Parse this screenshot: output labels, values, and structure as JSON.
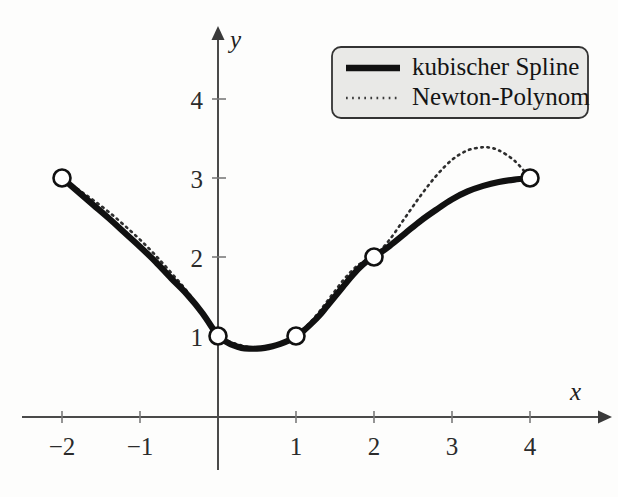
{
  "figure": {
    "background_color": "#fdfdfc",
    "axis_color": "#4a4a4a",
    "spline_color": "#111111",
    "newton_color": "#2e2e2e",
    "legend_fill": "#e9e9e7"
  },
  "axes": {
    "x_name": "x",
    "y_name": "y",
    "x_ticks": [
      {
        "label": "−2",
        "value": -2
      },
      {
        "label": "−1",
        "value": -1
      },
      {
        "label": "1",
        "value": 1
      },
      {
        "label": "2",
        "value": 2
      },
      {
        "label": "3",
        "value": 3
      },
      {
        "label": "4",
        "value": 4
      }
    ],
    "y_ticks": [
      {
        "label": "1",
        "value": 1
      },
      {
        "label": "2",
        "value": 2
      },
      {
        "label": "3",
        "value": 3
      },
      {
        "label": "4",
        "value": 4
      }
    ]
  },
  "legend": {
    "position": "top-right",
    "entries": [
      {
        "label": "kubischer Spline",
        "style": "solid-thick"
      },
      {
        "label": "Newton-Polynom",
        "style": "dotted"
      }
    ]
  },
  "chart_data": {
    "type": "line",
    "title": "",
    "subtitle": "",
    "xlabel": "x",
    "ylabel": "y",
    "xlim": [
      -2.55,
      5.0
    ],
    "ylim": [
      -0.35,
      4.65
    ],
    "grid": false,
    "legend_position": "top-right",
    "annotations": [],
    "knots": {
      "name": "Stützstellen",
      "marker": "open-circle",
      "x": [
        -2,
        0,
        1,
        2,
        4
      ],
      "y": [
        3,
        1,
        1,
        2,
        3
      ]
    },
    "series": [
      {
        "name": "kubischer Spline",
        "style": "solid-thick",
        "color": "#111111",
        "x": [
          -2.0,
          -1.8,
          -1.6,
          -1.4,
          -1.2,
          -1.0,
          -0.8,
          -0.6,
          -0.4,
          -0.2,
          0.0,
          0.1,
          0.2,
          0.3,
          0.4,
          0.5,
          0.6,
          0.7,
          0.8,
          0.9,
          1.0,
          1.1,
          1.2,
          1.3,
          1.4,
          1.5,
          1.6,
          1.7,
          1.8,
          1.9,
          2.0,
          2.2,
          2.4,
          2.6,
          2.8,
          3.0,
          3.2,
          3.4,
          3.6,
          3.8,
          4.0
        ],
        "y": [
          3.0,
          2.83,
          2.66,
          2.49,
          2.31,
          2.13,
          1.94,
          1.73,
          1.53,
          1.29,
          1.0,
          0.93,
          0.88,
          0.85,
          0.84,
          0.84,
          0.85,
          0.87,
          0.9,
          0.94,
          1.0,
          1.07,
          1.16,
          1.26,
          1.38,
          1.5,
          1.62,
          1.74,
          1.85,
          1.94,
          2.0,
          2.14,
          2.3,
          2.46,
          2.6,
          2.73,
          2.83,
          2.9,
          2.95,
          2.98,
          3.0
        ]
      },
      {
        "name": "Newton-Polynom",
        "style": "dotted",
        "color": "#2e2e2e",
        "x": [
          -2.0,
          -1.8,
          -1.6,
          -1.4,
          -1.2,
          -1.0,
          -0.8,
          -0.6,
          -0.4,
          -0.2,
          0.0,
          0.1,
          0.2,
          0.3,
          0.4,
          0.5,
          0.6,
          0.7,
          0.8,
          0.9,
          1.0,
          1.1,
          1.2,
          1.3,
          1.4,
          1.5,
          1.6,
          1.7,
          1.8,
          1.9,
          2.0,
          2.2,
          2.4,
          2.6,
          2.8,
          3.0,
          3.2,
          3.4,
          3.5,
          3.6,
          3.8,
          4.0
        ],
        "y": [
          3.0,
          2.86,
          2.72,
          2.57,
          2.4,
          2.22,
          2.02,
          1.8,
          1.57,
          1.3,
          1.0,
          0.95,
          0.91,
          0.88,
          0.86,
          0.85,
          0.85,
          0.86,
          0.89,
          0.93,
          1.0,
          1.09,
          1.19,
          1.31,
          1.44,
          1.57,
          1.7,
          1.81,
          1.9,
          1.96,
          2.0,
          2.22,
          2.5,
          2.78,
          3.03,
          3.23,
          3.35,
          3.39,
          3.38,
          3.35,
          3.22,
          3.0
        ]
      }
    ]
  }
}
